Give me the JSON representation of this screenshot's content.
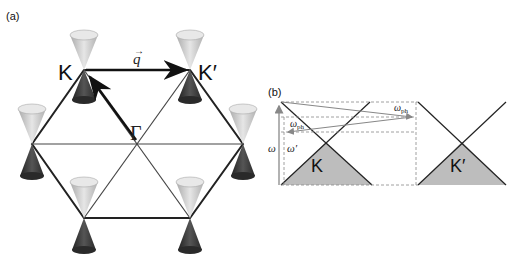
{
  "panel_a": {
    "label": "(a)",
    "k_label": "K",
    "kprime_label": "K′",
    "gamma_label": "Γ",
    "q_label": "q",
    "q_arrow": "→"
  },
  "panel_b": {
    "label": "(b)",
    "k_label": "K",
    "kprime_label": "K′",
    "omega_label": "ω",
    "omega_prime_label": "ω′",
    "omega_ph_label": "ω",
    "ph_sub": "ph"
  },
  "colors": {
    "light_cone": "#c8c8c8",
    "dark_cone": "#3a3a3a",
    "shade": "#bdbdbd",
    "line": "#222222",
    "arrow_gray": "#888888"
  }
}
